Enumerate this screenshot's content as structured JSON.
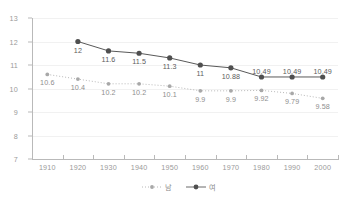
{
  "chart_data": {
    "type": "line",
    "title": "",
    "xlabel": "",
    "ylabel": "",
    "categories": [
      "1910",
      "1920",
      "1930",
      "1940",
      "1950",
      "1960",
      "1970",
      "1980",
      "1990",
      "2000"
    ],
    "ylim": [
      7,
      13
    ],
    "yticks": [
      7,
      8,
      9,
      10,
      11,
      12,
      13
    ],
    "grid": true,
    "legend_position": "bottom-center",
    "series": [
      {
        "name": "남",
        "color": "#b0b0b0",
        "linestyle": "dotted",
        "marker": "small-circle",
        "label_position": "below",
        "values": [
          10.6,
          10.4,
          10.2,
          10.2,
          10.1,
          9.9,
          9.9,
          9.92,
          9.79,
          9.58
        ],
        "value_labels": [
          "10.6",
          "10.4",
          "10.2",
          "10.2",
          "10.1",
          "9.9",
          "9.9",
          "9.92",
          "9.79",
          "9.58"
        ]
      },
      {
        "name": "여",
        "color": "#595959",
        "linestyle": "solid",
        "marker": "circle",
        "label_position": "below",
        "values": [
          null,
          12,
          11.6,
          11.5,
          11.3,
          11,
          10.88,
          10.49,
          10.49,
          10.49
        ],
        "value_labels": [
          "",
          "12",
          "11.6",
          "11.5",
          "11.3",
          "11",
          "10.88",
          "10.49",
          "10.49",
          "10.49"
        ]
      }
    ]
  },
  "axes": {
    "y_tick_labels": [
      "13",
      "12",
      "11",
      "10",
      "9",
      "8",
      "7"
    ],
    "x_tick_labels": [
      "1910",
      "1920",
      "1930",
      "1940",
      "1950",
      "1960",
      "1970",
      "1980",
      "1990",
      "2000"
    ]
  },
  "legend": {
    "items": [
      {
        "label": "남",
        "marker": "dotted-dot-marker"
      },
      {
        "label": "여",
        "marker": "solid-dot-marker"
      }
    ]
  }
}
